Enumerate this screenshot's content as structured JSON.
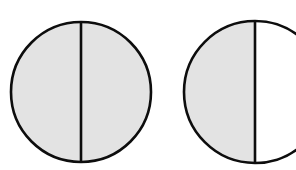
{
  "figure": {
    "name": "fraction-circles-diagram",
    "background_color": "#ffffff",
    "canvas": {
      "width": 296,
      "height": 170
    },
    "colors": {
      "outline": "#0d0d0d",
      "shaded_fill": "#e3e3e3",
      "unshaded_fill": "#ffffff"
    },
    "stroke_width": 2.6,
    "shapes": [
      {
        "id": "circle-whole",
        "label": "whole-circle-fully-shaded",
        "center_x": 81,
        "center_y": 92,
        "radius": 70,
        "divider_x": 81,
        "left_half_shaded": true,
        "right_half_shaded": true,
        "shaded_halves": 2,
        "total_halves": 2,
        "fraction_text": "1",
        "clipped": false
      },
      {
        "id": "circle-half",
        "label": "half-circle-left-shaded",
        "center_x": 255,
        "center_y": 92,
        "radius": 71,
        "divider_x": 255,
        "left_half_shaded": true,
        "right_half_shaded": false,
        "shaded_halves": 1,
        "total_halves": 2,
        "fraction_text": "1/2",
        "clipped": true
      }
    ]
  },
  "chart_data": {
    "type": "pie",
    "title": "",
    "xlabel": "",
    "ylabel": "",
    "legend": [],
    "grid": false,
    "series": [
      {
        "name": "circle-whole",
        "categories": [
          "left half",
          "right half"
        ],
        "values": [
          50,
          50
        ],
        "shaded": [
          true,
          true
        ],
        "shaded_fraction": 1.0
      },
      {
        "name": "circle-half",
        "categories": [
          "left half",
          "right half"
        ],
        "values": [
          50,
          50
        ],
        "shaded": [
          true,
          false
        ],
        "shaded_fraction": 0.5
      }
    ]
  }
}
